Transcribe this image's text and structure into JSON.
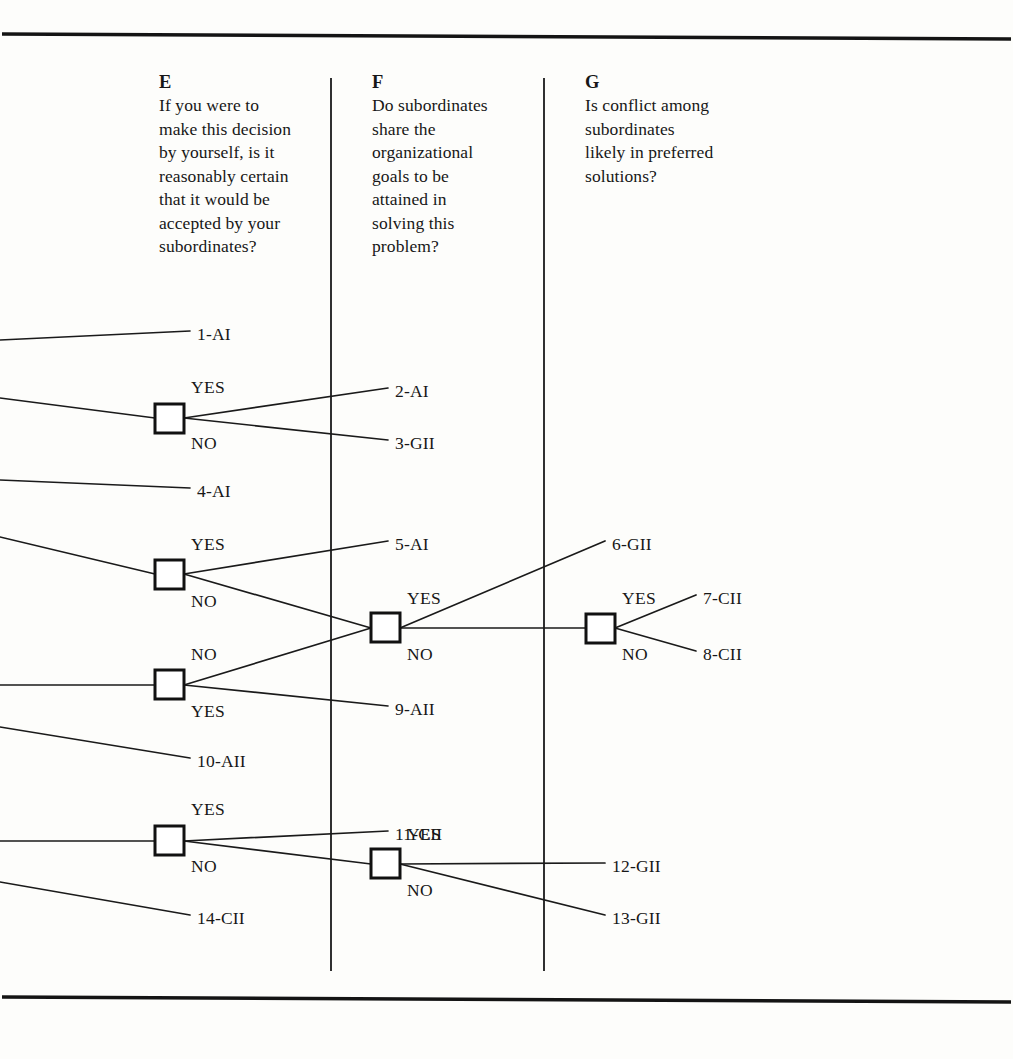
{
  "figure": {
    "type": "decision-tree",
    "columns": [
      {
        "id": "E",
        "letter": "E",
        "question": "If you were to\nmake this decision\nby yourself, is it\nreasonably certain\nthat it would be\naccepted by your\nsubordinates?"
      },
      {
        "id": "F",
        "letter": "F",
        "question": "Do subordinates\nshare the\norganizational\ngoals to be\nattained in\nsolving this\nproblem?"
      },
      {
        "id": "G",
        "letter": "G",
        "question": "Is conflict among\nsubordinates\nlikely in preferred\nsolutions?"
      }
    ],
    "branch_labels": [
      {
        "id": "e1-yes",
        "text": "YES",
        "x": 191,
        "y": 378
      },
      {
        "id": "e1-no",
        "text": "NO",
        "x": 191,
        "y": 434
      },
      {
        "id": "e2-yes",
        "text": "YES",
        "x": 191,
        "y": 535
      },
      {
        "id": "e2-no",
        "text": "NO",
        "x": 191,
        "y": 592
      },
      {
        "id": "e3-no",
        "text": "NO",
        "x": 191,
        "y": 645
      },
      {
        "id": "e3-yes",
        "text": "YES",
        "x": 191,
        "y": 702
      },
      {
        "id": "e4-yes",
        "text": "YES",
        "x": 191,
        "y": 800
      },
      {
        "id": "e4-no",
        "text": "NO",
        "x": 191,
        "y": 857
      },
      {
        "id": "f1-yes",
        "text": "YES",
        "x": 407,
        "y": 589
      },
      {
        "id": "f1-no",
        "text": "NO",
        "x": 407,
        "y": 645
      },
      {
        "id": "f2-yes",
        "text": "YES",
        "x": 407,
        "y": 825
      },
      {
        "id": "f2-no",
        "text": "NO",
        "x": 407,
        "y": 881
      },
      {
        "id": "g1-yes",
        "text": "YES",
        "x": 622,
        "y": 589
      },
      {
        "id": "g1-no",
        "text": "NO",
        "x": 622,
        "y": 645
      }
    ],
    "outcomes": [
      {
        "id": "o1",
        "text": "1-AI",
        "x": 197,
        "y": 325
      },
      {
        "id": "o2",
        "text": "2-AI",
        "x": 395,
        "y": 382
      },
      {
        "id": "o3",
        "text": "3-GII",
        "x": 395,
        "y": 434
      },
      {
        "id": "o4",
        "text": "4-AI",
        "x": 197,
        "y": 482
      },
      {
        "id": "o5",
        "text": "5-AI",
        "x": 395,
        "y": 535
      },
      {
        "id": "o6",
        "text": "6-GII",
        "x": 612,
        "y": 535
      },
      {
        "id": "o7",
        "text": "7-CII",
        "x": 703,
        "y": 589
      },
      {
        "id": "o8",
        "text": "8-CII",
        "x": 703,
        "y": 645
      },
      {
        "id": "o9",
        "text": "9-AII",
        "x": 395,
        "y": 700
      },
      {
        "id": "o10",
        "text": "10-AII",
        "x": 197,
        "y": 752
      },
      {
        "id": "o11",
        "text": "11-CII",
        "x": 395,
        "y": 825
      },
      {
        "id": "o12",
        "text": "12-GII",
        "x": 612,
        "y": 857
      },
      {
        "id": "o13",
        "text": "13-GII",
        "x": 612,
        "y": 909
      },
      {
        "id": "o14",
        "text": "14-CII",
        "x": 197,
        "y": 909
      }
    ],
    "nodes": [
      {
        "id": "E1",
        "column": "E",
        "x": 155,
        "y": 404,
        "size": 29
      },
      {
        "id": "E2",
        "column": "E",
        "x": 155,
        "y": 560,
        "size": 29
      },
      {
        "id": "E3",
        "column": "E",
        "x": 155,
        "y": 670,
        "size": 29
      },
      {
        "id": "E4",
        "column": "E",
        "x": 155,
        "y": 826,
        "size": 29
      },
      {
        "id": "F1",
        "column": "F",
        "x": 371,
        "y": 613,
        "size": 29
      },
      {
        "id": "F2",
        "column": "F",
        "x": 371,
        "y": 849,
        "size": 29
      },
      {
        "id": "G1",
        "column": "G",
        "x": 586,
        "y": 614,
        "size": 29
      }
    ],
    "rules": {
      "top_y": 36,
      "bottom_y": 999,
      "divider_E_F_x": 331,
      "divider_F_G_x": 544,
      "divider_top_y": 78,
      "divider_bottom_y": 971
    }
  }
}
